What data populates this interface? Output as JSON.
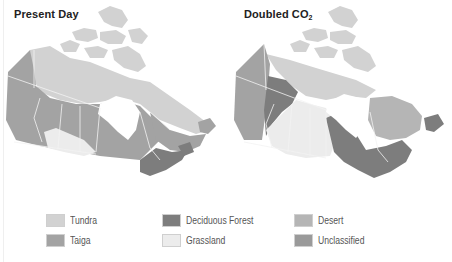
{
  "figure": {
    "panels": [
      {
        "id": "present",
        "title": "Present Day",
        "title_sub": ""
      },
      {
        "id": "doubled",
        "title": "Doubled CO",
        "title_sub": "2"
      }
    ],
    "legend": [
      {
        "label": "Tundra",
        "color": "#d2d2d2"
      },
      {
        "label": "Taiga",
        "color": "#a3a3a3"
      },
      {
        "label": "Deciduous Forest",
        "color": "#7d7d7d"
      },
      {
        "label": "Grassland",
        "color": "#ececec"
      },
      {
        "label": "Desert",
        "color": "#b5b5b5"
      },
      {
        "label": "Unclassified",
        "color": "#9a9a9a"
      }
    ],
    "colors": {
      "tundra": "#d2d2d2",
      "taiga": "#a3a3a3",
      "deciduous": "#7d7d7d",
      "grassland": "#ececec",
      "desert": "#b5b5b5",
      "unclassified": "#9a9a9a",
      "water": "#ffffff",
      "border": "#f2f2f2"
    }
  }
}
